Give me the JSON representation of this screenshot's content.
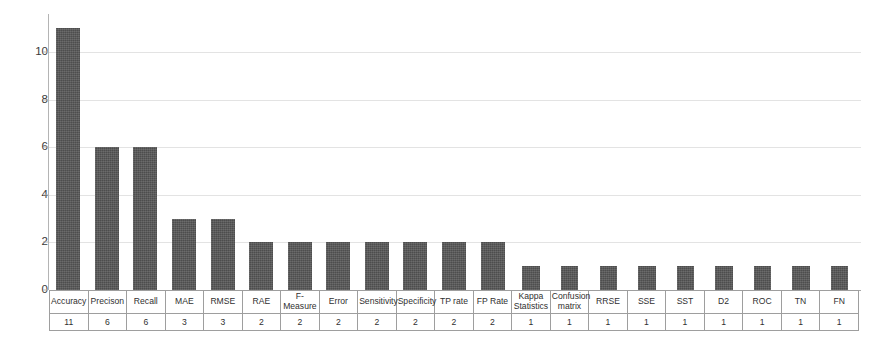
{
  "chart_data": {
    "type": "bar",
    "title": "",
    "subtitle": "",
    "xlabel": "",
    "ylabel": "",
    "ylim": [
      0,
      11.6
    ],
    "grid": true,
    "legend": false,
    "y_ticks": [
      "0",
      "2",
      "4",
      "6",
      "8",
      "10"
    ],
    "y_tick_values": [
      0,
      2,
      4,
      6,
      8,
      10
    ],
    "bar_color": "#565656",
    "gridline_color": "#e3e3e3",
    "axis_color": "#a8a8a8",
    "categories": [
      "Accuracy",
      "Precison",
      "Recall",
      "MAE",
      "RMSE",
      "RAE",
      "F-Measure",
      "Error",
      "Sensitivity",
      "Specificity",
      "TP rate",
      "FP Rate",
      "Kappa Statistics",
      "Confusion matrix",
      "RRSE",
      "SSE",
      "SST",
      "D2",
      "ROC",
      "TN",
      "FN"
    ],
    "values": [
      11,
      6,
      6,
      3,
      3,
      2,
      2,
      2,
      2,
      2,
      2,
      2,
      1,
      1,
      1,
      1,
      1,
      1,
      1,
      1,
      1
    ],
    "value_labels": [
      "11",
      "6",
      "6",
      "3",
      "3",
      "2",
      "2",
      "2",
      "2",
      "2",
      "2",
      "2",
      "1",
      "1",
      "1",
      "1",
      "1",
      "1",
      "1",
      "1",
      "1"
    ]
  },
  "table": {
    "category_row_name": "metric-name-row",
    "value_row_name": "metric-count-row"
  }
}
